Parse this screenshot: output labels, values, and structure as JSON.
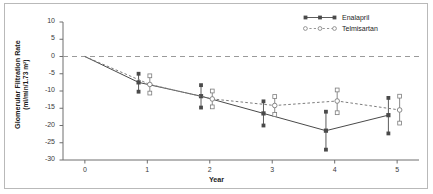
{
  "figure": {
    "border_color": "#b9b9b9",
    "background": "#ffffff"
  },
  "axes": {
    "xlabel": "Year",
    "ylabel_line1": "Glomerular Filtration Rate",
    "ylabel_line2": "(ml/min/1.73 m²)",
    "x_ticks": [
      "0",
      "1",
      "2",
      "3",
      "4",
      "5"
    ],
    "y_ticks": [
      "10",
      "5",
      "0",
      "-5",
      "-10",
      "-15",
      "-20",
      "-25",
      "-30"
    ],
    "xlim": [
      -0.35,
      5.35
    ],
    "ylim": [
      -30,
      10
    ],
    "zero_line": "dashed"
  },
  "legend": {
    "items": [
      {
        "label": "Enalapril",
        "marker": "filled-square",
        "line": "solid",
        "color": "#4a4a4a"
      },
      {
        "label": "Telmisartan",
        "marker": "open-circle",
        "line": "dashed",
        "color": "#7d7d7d"
      }
    ]
  },
  "chart_data": {
    "type": "line",
    "title": "",
    "xlabel": "Year",
    "ylabel": "Glomerular Filtration Rate (ml/min/1.73 m²)",
    "xlim": [
      -0.35,
      5.35
    ],
    "ylim": [
      -30,
      10
    ],
    "grid": false,
    "legend_position": "top-right",
    "zero_reference_line": 0,
    "x": [
      0,
      1,
      2,
      3,
      4,
      5
    ],
    "series": [
      {
        "name": "Enalapril",
        "marker": "filled-square",
        "linestyle": "solid",
        "color": "#4a4a4a",
        "x_offset": -0.14,
        "values": [
          0,
          -7.5,
          -11.5,
          -16.5,
          -21.5,
          -17.0
        ],
        "ci_low": [
          null,
          -10.2,
          -14.8,
          -20.0,
          -27.0,
          -22.3
        ],
        "ci_high": [
          null,
          -5.0,
          -8.3,
          -13.0,
          -16.0,
          -12.0
        ]
      },
      {
        "name": "Telmisartan",
        "marker": "open-circle",
        "linestyle": "dashed",
        "color": "#7d7d7d",
        "x_offset": 0.04,
        "values": [
          0,
          -8.1,
          -12.3,
          -14.2,
          -12.9,
          -15.5
        ],
        "ci_low": [
          null,
          -10.6,
          -14.6,
          -16.8,
          -16.3,
          -19.3
        ],
        "ci_high": [
          null,
          -5.6,
          -10.0,
          -11.6,
          -9.7,
          -11.5
        ]
      }
    ]
  }
}
